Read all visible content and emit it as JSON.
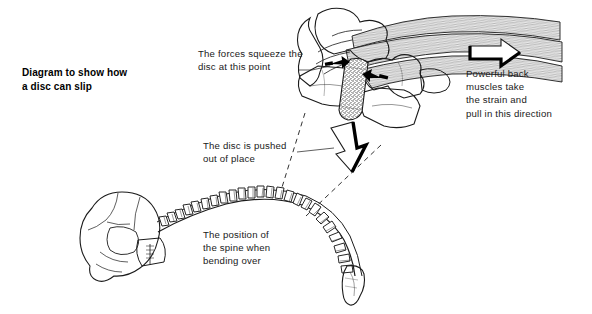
{
  "figure": {
    "title": "Diagram to show how\na disc can slip",
    "background_color": "#ffffff",
    "ink_color": "#1b1b1b",
    "disc_fill_color": "#9a9a9a"
  },
  "annotations": [
    {
      "id": "forces-squeeze",
      "text": "The forces squeeze the\ndisc at this point",
      "x": 198,
      "y": 47
    },
    {
      "id": "disc-pushed",
      "text": "The disc is pushed\nout of place",
      "x": 203,
      "y": 139
    },
    {
      "id": "spine-position",
      "text": "The position of\nthe spine when\nbending over",
      "x": 203,
      "y": 228
    },
    {
      "id": "back-muscles",
      "text": "Powerful back\nmuscles take\nthe strain and\npull in this direction",
      "x": 466,
      "y": 67
    }
  ],
  "parts": [
    {
      "id": "skull",
      "label": "skull"
    },
    {
      "id": "spine-curve",
      "label": "curved spine bending over"
    },
    {
      "id": "sacrum",
      "label": "sacrum and coccyx"
    },
    {
      "id": "vertebra-upper",
      "label": "upper vertebra"
    },
    {
      "id": "vertebra-lower",
      "label": "lower vertebra"
    },
    {
      "id": "slipped-disc",
      "label": "slipped intervertebral disc"
    },
    {
      "id": "back-muscle-bundle",
      "label": "back muscle bundle"
    },
    {
      "id": "squeeze-arrow-upper",
      "label": "squeezing force arrow upper"
    },
    {
      "id": "squeeze-arrow-lower",
      "label": "squeezing force arrow lower"
    },
    {
      "id": "disc-displacement-arrow",
      "label": "disc displacement arrow"
    },
    {
      "id": "muscle-pull-arrow",
      "label": "muscle pull direction arrow"
    },
    {
      "id": "magnifier-line-upper",
      "label": "detail callout line upper"
    },
    {
      "id": "magnifier-line-lower",
      "label": "detail callout line lower"
    }
  ]
}
